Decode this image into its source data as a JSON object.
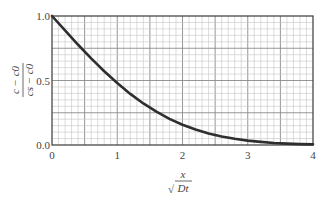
{
  "chart_data": {
    "type": "line",
    "title": "",
    "xlabel": "x / √(Dt)",
    "ylabel": "(c − c0) / (cs − c0)",
    "xlabel_parts": {
      "numerator": "x",
      "denominator": "Dt",
      "radical": "√"
    },
    "ylabel_parts": {
      "numerator": "c − c0",
      "denominator": "cs − c0"
    },
    "xlim": [
      0,
      4
    ],
    "ylim": [
      0.0,
      1.0
    ],
    "x_ticks": [
      "0",
      "1",
      "2",
      "3",
      "4"
    ],
    "y_ticks": [
      "0.0",
      "0.5",
      "1.0"
    ],
    "grid": {
      "on": true,
      "x_minor_step": 0.1,
      "x_major_step": 0.5,
      "y_minor_step": 0.05,
      "y_major_step": 0.25
    },
    "legend": null,
    "series": [
      {
        "name": "erfc(x / 2√(Dt))",
        "x": [
          0.0,
          0.2,
          0.4,
          0.6,
          0.8,
          1.0,
          1.2,
          1.4,
          1.6,
          1.8,
          2.0,
          2.2,
          2.4,
          2.6,
          2.8,
          3.0,
          3.2,
          3.4,
          3.6,
          3.8,
          4.0
        ],
        "values": [
          1.0,
          0.888,
          0.777,
          0.671,
          0.572,
          0.48,
          0.396,
          0.322,
          0.258,
          0.203,
          0.157,
          0.12,
          0.09,
          0.066,
          0.048,
          0.034,
          0.024,
          0.016,
          0.011,
          0.007,
          0.005
        ]
      }
    ]
  },
  "colors": {
    "curve": "#2e2e2e",
    "frame": "#3a3a3a",
    "grid_minor": "#c4c4c4",
    "grid_major": "#8a8a8a",
    "text": "#444444"
  }
}
